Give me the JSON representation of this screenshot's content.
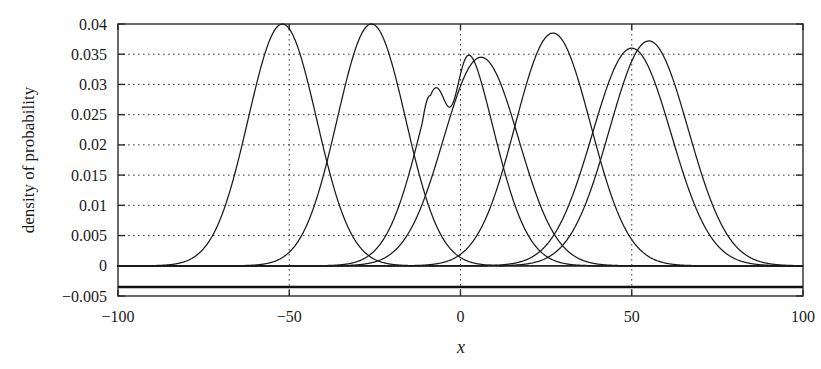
{
  "chart_data": {
    "type": "line",
    "title": "",
    "xlabel": "x",
    "ylabel": "density of probability",
    "xlim": [
      -100,
      100
    ],
    "ylim": [
      -0.005,
      0.04
    ],
    "grid": true,
    "legend": "none",
    "x_ticks": [
      -100,
      -50,
      0,
      50,
      100
    ],
    "x_tick_labels": [
      "-100",
      "-50",
      "0",
      "50",
      "100"
    ],
    "y_ticks": [
      -0.005,
      0,
      0.005,
      0.01,
      0.015,
      0.02,
      0.025,
      0.03,
      0.035,
      0.04
    ],
    "y_tick_labels": [
      "-0.005",
      "0",
      "0.005",
      "0.01",
      "0.015",
      "0.02",
      "0.025",
      "0.03",
      "0.035",
      "0.04"
    ],
    "gridlines_y": [
      0.005,
      0.01,
      0.015,
      0.02,
      0.025,
      0.03,
      0.035
    ],
    "gridlines_x": [
      -50,
      0,
      50
    ],
    "zero_reference_line": 0,
    "series": [
      {
        "name": "component-1",
        "mean": -52,
        "sigma": 10.0,
        "peak": 0.04,
        "shape": "gaussian"
      },
      {
        "name": "component-2",
        "mean": -26,
        "sigma": 10.0,
        "peak": 0.04,
        "shape": "gaussian"
      },
      {
        "name": "component-3",
        "mean": -1,
        "sigma": 10.3,
        "peak": 0.0385,
        "shape": "bimodal-gaussian",
        "secondary_mean": -8.5,
        "secondary_sigma": 4.2,
        "secondary_peak": 0.029,
        "valley": 0.0268
      },
      {
        "name": "component-4",
        "mean": 6,
        "sigma": 11.0,
        "peak": 0.0345,
        "shape": "gaussian"
      },
      {
        "name": "component-5",
        "mean": 27,
        "sigma": 11.0,
        "peak": 0.0385,
        "shape": "gaussian"
      },
      {
        "name": "component-6",
        "mean": 50,
        "sigma": 11.5,
        "peak": 0.036,
        "shape": "gaussian"
      },
      {
        "name": "component-7",
        "mean": 55,
        "sigma": 11.5,
        "peak": 0.0372,
        "shape": "gaussian"
      }
    ]
  },
  "plot_geometry": {
    "left": 118,
    "right": 803,
    "top": 24,
    "bottom": 296
  }
}
